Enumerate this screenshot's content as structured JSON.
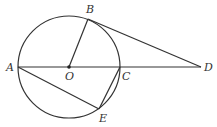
{
  "diagram": {
    "type": "geometry",
    "colors": {
      "stroke": "#333333",
      "background": "#ffffff"
    },
    "circle": {
      "center": "O",
      "cx": 69,
      "cy": 67,
      "r": 51
    },
    "points": {
      "A": {
        "label": "A",
        "x": 18,
        "y": 67
      },
      "O": {
        "label": "O",
        "x": 69,
        "y": 67
      },
      "C": {
        "label": "C",
        "x": 120,
        "y": 67
      },
      "D": {
        "label": "D",
        "x": 201,
        "y": 67
      },
      "B": {
        "label": "B",
        "x": 88,
        "y": 19
      },
      "E": {
        "label": "E",
        "x": 99,
        "y": 109
      }
    },
    "segments": [
      "AD",
      "OB",
      "BD",
      "AE",
      "CE"
    ]
  }
}
